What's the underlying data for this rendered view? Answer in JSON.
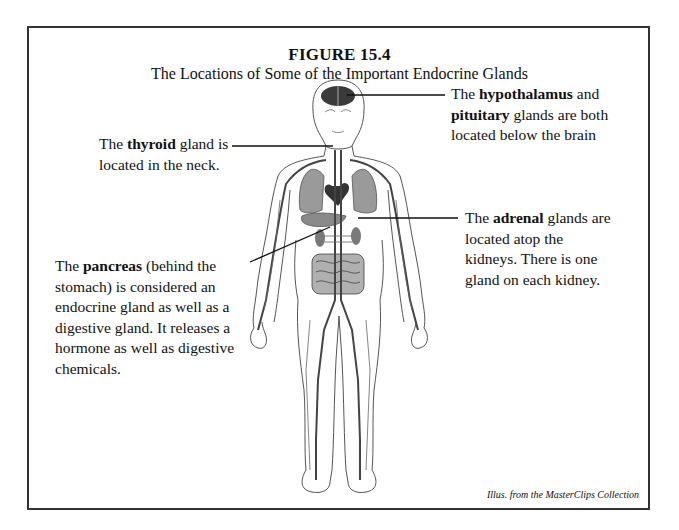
{
  "figure": {
    "title": "FIGURE 15.4",
    "subtitle": "The Locations of Some of the Important Endocrine Glands",
    "credit": "Illus. from the MasterClips Collection"
  },
  "labels": {
    "hypothalamus": {
      "pre": "The ",
      "bold1": "hypothalamus",
      "mid": " and",
      "bold2": "pituitary",
      "post": " glands are both",
      "line3": "located below the brain"
    },
    "thyroid": {
      "pre": "The ",
      "bold": "thyroid",
      "post": " gland is",
      "line2": "located in the neck."
    },
    "adrenal": {
      "pre": "The ",
      "bold": "adrenal",
      "post": " glands are",
      "line2": "located atop the",
      "line3": "kidneys.  There is one",
      "line4": "gland on each kidney."
    },
    "pancreas": {
      "pre": "The ",
      "bold": "pancreas",
      "post": " (behind the",
      "line2": "stomach) is considered an",
      "line3": "endocrine gland as well as a",
      "line4": "digestive gland.  It releases a",
      "line5": "hormone as well as digestive",
      "line6": "chemicals."
    }
  },
  "illustration": {
    "subject": "human-body-circulatory-endocrine",
    "highlighted_glands": [
      "hypothalamus",
      "pituitary",
      "thyroid",
      "adrenal",
      "pancreas"
    ]
  },
  "colors": {
    "frame": "#333333",
    "gland_dark": "#3a3a3a",
    "organ_gray": "#9a9a9a",
    "vessel": "#444444"
  }
}
